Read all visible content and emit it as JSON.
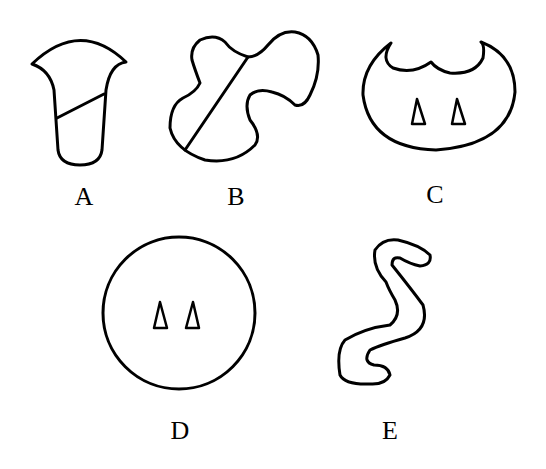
{
  "figure": {
    "shapes": [
      {
        "label": "A",
        "name": "funnel-shape-with-line"
      },
      {
        "label": "B",
        "name": "irregular-blob-with-diagonal-line"
      },
      {
        "label": "C",
        "name": "crescent-top-oval-with-two-triangles"
      },
      {
        "label": "D",
        "name": "circle-with-two-triangles"
      },
      {
        "label": "E",
        "name": "s-shaped-worm"
      }
    ]
  },
  "labels": {
    "a": "A",
    "b": "B",
    "c": "C",
    "d": "D",
    "e": "E"
  }
}
